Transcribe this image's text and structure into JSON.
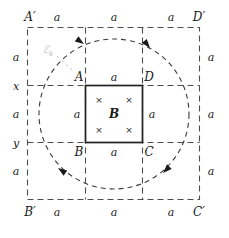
{
  "figure": {
    "title_text": "",
    "colors": {
      "stroke_solid": "#2b2b2b",
      "stroke_dashed": "#4d4d4d",
      "emf_label": "#b9b9b9",
      "background": "#ffffff"
    },
    "outer_square": {
      "corners": {
        "top_left": "A′",
        "top_right": "D′",
        "bottom_left": "B′",
        "bottom_right": "C′"
      },
      "top_segments": [
        "a",
        "a",
        "a"
      ],
      "bottom_segments": [
        "a",
        "a",
        "a"
      ],
      "right_segments": [
        "a",
        "a",
        "a"
      ],
      "left_segments": [
        "a",
        "x",
        "a",
        "y",
        "a"
      ]
    },
    "inner_square": {
      "corners": {
        "top_left": "A",
        "top_right": "D",
        "bottom_left": "B",
        "bottom_right": "C"
      },
      "side_labels": {
        "top": "a",
        "bottom": "a",
        "left": "a",
        "right": "a"
      },
      "field_label": "B",
      "field_direction_marks": [
        "×",
        "×",
        "×",
        "×"
      ],
      "field_direction_meaning": "into-page"
    },
    "circle": {
      "label": "ℰ",
      "label_subscript": "k",
      "style": "dashed",
      "direction": "counterclockwise",
      "arrowhead_count": 4
    },
    "left_axis_ticks": [
      "x",
      "y"
    ]
  }
}
